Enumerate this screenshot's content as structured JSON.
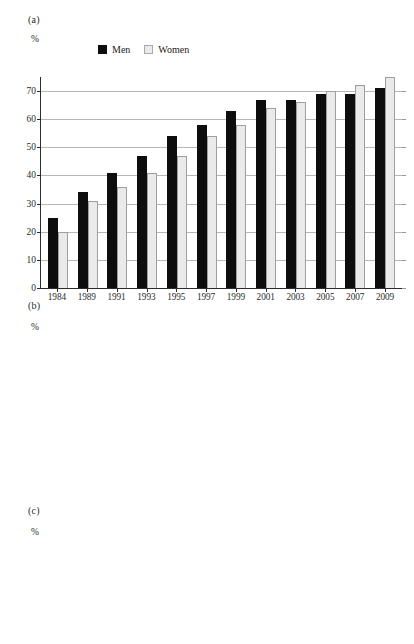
{
  "crop_text": "",
  "legend": {
    "men_label": "Men",
    "women_label": "Women",
    "men_color": "#0d0d0d",
    "women_color": "#ebeaea"
  },
  "axis_unit": "%",
  "panels": {
    "a": {
      "tag": "(a)"
    },
    "b": {
      "tag": "(b)"
    },
    "c": {
      "tag": "(c)"
    }
  },
  "chart_data": [
    {
      "id": "a",
      "type": "bar",
      "title": "(a)",
      "xlabel": "",
      "ylabel": "%",
      "ylim": [
        0,
        75
      ],
      "yticks": [
        0,
        10,
        20,
        30,
        40,
        50,
        60,
        70
      ],
      "grid": true,
      "legend_position": "top-center",
      "categories": [
        "1984",
        "1989",
        "1991",
        "1993",
        "1995",
        "1997",
        "1999",
        "2001",
        "2003",
        "2005",
        "2007",
        "2009"
      ],
      "series": [
        {
          "name": "Men",
          "values": [
            25,
            34,
            41,
            47,
            54,
            58,
            63,
            67,
            67,
            69,
            69,
            71
          ]
        },
        {
          "name": "Women",
          "values": [
            20,
            31,
            36,
            41,
            47,
            54,
            58,
            64,
            66,
            70,
            72,
            75
          ]
        }
      ]
    },
    {
      "id": "b",
      "type": "bar",
      "title": "(b)",
      "xlabel": "",
      "ylabel": "%",
      "ylim": [
        0,
        43
      ],
      "yticks": [
        0,
        10,
        20,
        30,
        40
      ],
      "grid": true,
      "legend_position": "none",
      "categories": [
        "1989",
        "1991",
        "1993",
        "1995",
        "1997",
        "1999",
        "2001",
        "2003",
        "2005",
        "2007",
        "2009"
      ],
      "series": [
        {
          "name": "Men",
          "values": [
            9,
            11,
            15,
            20,
            24,
            29,
            33,
            34,
            34,
            36,
            40
          ]
        },
        {
          "name": "Women",
          "values": [
            13,
            16,
            20,
            24,
            28,
            32,
            35,
            37,
            37,
            38,
            42
          ]
        }
      ]
    },
    {
      "id": "c",
      "type": "bar",
      "title": "(c)",
      "xlabel": "",
      "ylabel": "%",
      "ylim": [
        0,
        21
      ],
      "yticks": [
        0,
        10,
        20
      ],
      "grid": true,
      "legend_position": "none",
      "categories": [
        "1989",
        "1991",
        "1993",
        "1995",
        "1997",
        "1999",
        "2001",
        "2003",
        "2005",
        "2007",
        "2009"
      ],
      "series": [
        {
          "name": "Men",
          "values": [
            3,
            3,
            4,
            6,
            8,
            10,
            12,
            13,
            11,
            13,
            15
          ]
        },
        {
          "name": "Women",
          "values": [
            4,
            5,
            6,
            8,
            11,
            14,
            16,
            18,
            17,
            17,
            20
          ]
        }
      ]
    }
  ]
}
